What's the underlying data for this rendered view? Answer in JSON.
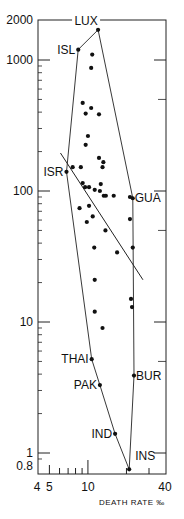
{
  "chart_data": {
    "type": "scatter",
    "title": "",
    "xlabel": "DEATH RATE ‰",
    "ylabel": "",
    "xscale": "log",
    "yscale": "log",
    "xlim": [
      4,
      40
    ],
    "ylim": [
      0.8,
      2000
    ],
    "grid": false,
    "legend": null,
    "x_ticks": [
      {
        "value": 4,
        "label": "4"
      },
      {
        "value": 5,
        "label": "5"
      },
      {
        "value": 10,
        "label": "10"
      },
      {
        "value": 40,
        "label": "40"
      }
    ],
    "x_minor_ticks": [
      5,
      6,
      7,
      8,
      9,
      10,
      20,
      30
    ],
    "y_ticks": [
      {
        "value": 2000,
        "label": "2000"
      },
      {
        "value": 1000,
        "label": "1000"
      },
      {
        "value": 100,
        "label": "100"
      },
      {
        "value": 10,
        "label": "10"
      },
      {
        "value": 1,
        "label": "1"
      },
      {
        "value": 0.8,
        "label": "0.8"
      }
    ],
    "labeled_points": [
      {
        "label": "LUX",
        "x": 12.0,
        "y": 1700,
        "label_pos": "top"
      },
      {
        "label": "ISL",
        "x": 8.4,
        "y": 1200,
        "label_pos": "left"
      },
      {
        "label": "ISR",
        "x": 6.8,
        "y": 140,
        "label_pos": "left"
      },
      {
        "label": "GUA",
        "x": 22.4,
        "y": 88,
        "label_pos": "right"
      },
      {
        "label": "THAI",
        "x": 10.7,
        "y": 5.2,
        "label_pos": "left"
      },
      {
        "label": "PAK",
        "x": 12.4,
        "y": 3.3,
        "label_pos": "left"
      },
      {
        "label": "BUR",
        "x": 22.9,
        "y": 3.9,
        "label_pos": "right"
      },
      {
        "label": "IND",
        "x": 16.3,
        "y": 1.4,
        "label_pos": "left"
      },
      {
        "label": "INS",
        "x": 21.0,
        "y": 0.75,
        "label_pos": "top-right"
      }
    ],
    "points": [
      {
        "x": 10.8,
        "y": 1100
      },
      {
        "x": 10.6,
        "y": 870
      },
      {
        "x": 9.1,
        "y": 470
      },
      {
        "x": 10.6,
        "y": 430
      },
      {
        "x": 9.6,
        "y": 390
      },
      {
        "x": 12.2,
        "y": 385
      },
      {
        "x": 10.0,
        "y": 263
      },
      {
        "x": 9.6,
        "y": 225
      },
      {
        "x": 12.2,
        "y": 179
      },
      {
        "x": 13.2,
        "y": 166
      },
      {
        "x": 13.0,
        "y": 152
      },
      {
        "x": 7.6,
        "y": 152
      },
      {
        "x": 8.8,
        "y": 152
      },
      {
        "x": 9.1,
        "y": 115
      },
      {
        "x": 9.5,
        "y": 107
      },
      {
        "x": 10.2,
        "y": 107
      },
      {
        "x": 11.3,
        "y": 102
      },
      {
        "x": 12.6,
        "y": 113
      },
      {
        "x": 12.4,
        "y": 100
      },
      {
        "x": 13.3,
        "y": 92
      },
      {
        "x": 13.8,
        "y": 92
      },
      {
        "x": 15.9,
        "y": 92
      },
      {
        "x": 21.3,
        "y": 90
      },
      {
        "x": 8.6,
        "y": 74
      },
      {
        "x": 10.2,
        "y": 77
      },
      {
        "x": 10.9,
        "y": 64
      },
      {
        "x": 9.8,
        "y": 58
      },
      {
        "x": 21.3,
        "y": 61
      },
      {
        "x": 13.7,
        "y": 50
      },
      {
        "x": 11.2,
        "y": 37
      },
      {
        "x": 16.9,
        "y": 34
      },
      {
        "x": 22.4,
        "y": 37
      },
      {
        "x": 11.3,
        "y": 21
      },
      {
        "x": 21.7,
        "y": 15
      },
      {
        "x": 22.1,
        "y": 13
      },
      {
        "x": 11.3,
        "y": 12
      },
      {
        "x": 13.0,
        "y": 9.0
      }
    ],
    "hull_polygon": [
      "ISL",
      "LUX",
      "GUA",
      "BUR",
      "INS",
      "IND",
      "PAK",
      "THAI",
      "ISR",
      "ISL"
    ],
    "regression_line": {
      "x": [
        6.1,
        26.9
      ],
      "y": [
        195,
        21
      ]
    }
  }
}
